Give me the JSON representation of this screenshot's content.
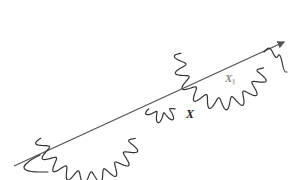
{
  "diagram": {
    "labels": {
      "x": "X",
      "x_parallel_main": "X",
      "x_parallel_sub": "∥"
    },
    "colors": {
      "axis": "#555555",
      "wave": "#333333",
      "label": "#222222",
      "label_faint": "#8a8a8a"
    },
    "axis": {
      "x1": 14,
      "y1": 166,
      "x2": 284,
      "y2": 42,
      "arrowhead": true
    },
    "waves": [
      {
        "name": "left-arc",
        "cx": 88,
        "cy": 130,
        "r": 48,
        "start_deg": 190,
        "end_deg": 350,
        "amp": 6,
        "cycles": 9
      },
      {
        "name": "right-arc",
        "cx": 222,
        "cy": 62,
        "r": 42,
        "start_deg": 168,
        "end_deg": 352,
        "amp": 6,
        "cycles": 9
      },
      {
        "name": "lower-bump",
        "cx": 162,
        "cy": 104,
        "r": 14,
        "start_deg": 160,
        "end_deg": 20,
        "amp": 5,
        "cycles": 3
      }
    ],
    "tails": [
      {
        "name": "left-tail",
        "points": [
          [
            40,
            155
          ],
          [
            30,
            160
          ],
          [
            22,
            168
          ],
          [
            30,
            172
          ],
          [
            48,
            172
          ]
        ]
      },
      {
        "name": "right-tail",
        "points": [
          [
            264,
            52
          ],
          [
            270,
            46
          ],
          [
            276,
            60
          ],
          [
            280,
            52
          ],
          [
            284,
            72
          ],
          [
            287,
            72
          ]
        ]
      }
    ]
  }
}
